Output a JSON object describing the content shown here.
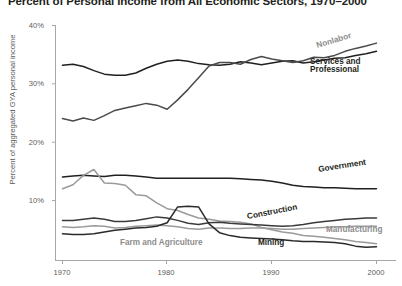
{
  "chart": {
    "title": "Percent of Personal Income from All Economic Sectors, 1970–2000",
    "ylabel": "Percent of aggregated GYA personal income",
    "xlabel": "",
    "yticks": [
      "10%",
      "20%",
      "30%",
      "40%"
    ],
    "xticks": [
      "1970",
      "1980",
      "1990",
      "2000"
    ]
  },
  "labels": {
    "nonlabor": "Nonlabor",
    "services_line1": "Services and",
    "services_line2": "Professional",
    "government": "Government",
    "construction": "Construction",
    "manufacturing": "Manufacturing",
    "mining": "Mining",
    "farm": "Farm and Agriculture"
  },
  "colors": {
    "dark": "#231f20",
    "gray": "#8c8c8c",
    "axis": "#a7a7a7",
    "tick_text": "#5b5b5b",
    "background": "#ffffff"
  },
  "chart_data": {
    "type": "line",
    "title": "Percent of Personal Income from All Economic Sectors, 1970–2000",
    "xlabel": "",
    "ylabel": "Percent of aggregated GYA personal income",
    "xlim": [
      1970,
      2000
    ],
    "ylim": [
      0,
      40
    ],
    "yticks": [
      10,
      20,
      30,
      40
    ],
    "xticks": [
      1970,
      1980,
      1990,
      2000
    ],
    "grid": false,
    "legend": "inline-labels",
    "x": [
      1970,
      1971,
      1972,
      1973,
      1974,
      1975,
      1976,
      1977,
      1978,
      1979,
      1980,
      1981,
      1982,
      1983,
      1984,
      1985,
      1986,
      1987,
      1988,
      1989,
      1990,
      1991,
      1992,
      1993,
      1994,
      1995,
      1996,
      1997,
      1998,
      1999,
      2000
    ],
    "series": [
      {
        "name": "Services and Professional",
        "color": "#231f20",
        "values": [
          33.1,
          33.3,
          32.9,
          32.2,
          31.6,
          31.4,
          31.4,
          31.8,
          32.6,
          33.3,
          33.8,
          34.0,
          33.8,
          33.4,
          33.2,
          33.1,
          33.3,
          33.7,
          33.5,
          33.2,
          33.5,
          33.8,
          33.9,
          33.5,
          33.7,
          34.0,
          34.3,
          34.4,
          34.8,
          35.1,
          35.5
        ]
      },
      {
        "name": "Nonlabor",
        "color": "#4a4a4a",
        "values": [
          24.0,
          23.6,
          24.1,
          23.7,
          24.5,
          25.4,
          25.8,
          26.2,
          26.6,
          26.3,
          25.6,
          27.2,
          29.0,
          31.0,
          33.0,
          33.6,
          33.6,
          33.3,
          34.1,
          34.6,
          34.2,
          33.9,
          33.6,
          33.9,
          34.5,
          34.4,
          34.8,
          35.5,
          36.0,
          36.4,
          36.9
        ]
      },
      {
        "name": "Government",
        "color": "#231f20",
        "values": [
          14.0,
          14.2,
          14.3,
          14.2,
          14.1,
          14.3,
          14.3,
          14.2,
          14.0,
          13.8,
          13.8,
          13.8,
          13.8,
          13.8,
          13.8,
          13.8,
          13.8,
          13.7,
          13.6,
          13.5,
          13.3,
          13.0,
          12.6,
          12.4,
          12.3,
          12.2,
          12.2,
          12.1,
          12.0,
          12.0,
          12.0
        ]
      },
      {
        "name": "Farm and Agriculture",
        "color": "#9a9a9a",
        "values": [
          12.0,
          12.7,
          14.3,
          15.3,
          13.0,
          12.9,
          12.6,
          11.0,
          10.8,
          9.6,
          8.6,
          8.3,
          7.6,
          7.0,
          6.8,
          6.5,
          6.4,
          6.3,
          6.0,
          5.4,
          5.0,
          4.6,
          4.4,
          4.0,
          3.9,
          3.7,
          3.5,
          3.3,
          3.0,
          2.8,
          2.6
        ]
      },
      {
        "name": "Construction",
        "color": "#3a3a3a",
        "values": [
          6.6,
          6.6,
          6.8,
          7.0,
          6.8,
          6.4,
          6.4,
          6.6,
          6.9,
          7.2,
          7.0,
          6.6,
          6.1,
          5.9,
          6.2,
          6.3,
          6.1,
          6.0,
          5.9,
          5.8,
          5.7,
          5.6,
          5.7,
          5.9,
          6.2,
          6.4,
          6.6,
          6.8,
          6.9,
          7.0,
          7.0
        ]
      },
      {
        "name": "Manufacturing",
        "color": "#9a9a9a",
        "values": [
          5.5,
          5.4,
          5.5,
          5.7,
          5.6,
          5.3,
          5.4,
          5.6,
          5.7,
          5.8,
          5.7,
          5.5,
          5.2,
          5.1,
          5.3,
          5.3,
          5.2,
          5.2,
          5.3,
          5.3,
          5.2,
          5.1,
          5.1,
          5.2,
          5.3,
          5.4,
          5.5,
          5.5,
          5.6,
          5.6,
          5.6
        ]
      },
      {
        "name": "Mining",
        "color": "#2b2b2b",
        "values": [
          4.3,
          4.2,
          4.2,
          4.3,
          4.6,
          4.9,
          5.1,
          5.3,
          5.4,
          5.6,
          6.2,
          8.9,
          9.0,
          8.9,
          6.0,
          4.5,
          4.0,
          3.7,
          3.6,
          3.5,
          3.4,
          3.3,
          3.1,
          3.0,
          3.0,
          2.9,
          2.8,
          2.6,
          2.2,
          2.0,
          2.1
        ]
      }
    ]
  }
}
